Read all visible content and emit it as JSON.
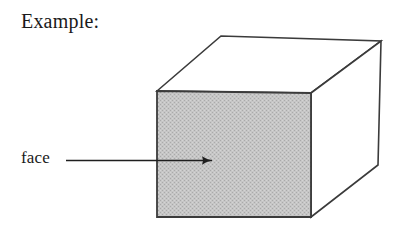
{
  "figure": {
    "heading": "Example:",
    "annotation_label": "face",
    "colors": {
      "background": "#ffffff",
      "outline": "#3b3b3b",
      "front_face_fill": "#c2c2c2",
      "text": "#1a1a1a",
      "arrow": "#1f1f1f"
    },
    "geometry": {
      "front_face": {
        "name": "shaded-front-face",
        "top_left": [
          157,
          91
        ],
        "top_right": [
          311,
          93
        ],
        "bottom_right": [
          311,
          217
        ],
        "bottom_left": [
          157,
          217
        ],
        "shaded": true
      },
      "top_face": {
        "name": "top-face",
        "front_left": [
          157,
          91
        ],
        "back_left": [
          221,
          36
        ],
        "back_right": [
          381,
          41
        ],
        "front_right": [
          311,
          93
        ],
        "shaded": false
      },
      "right_face": {
        "name": "right-side-face",
        "front_top": [
          311,
          93
        ],
        "back_top": [
          381,
          41
        ],
        "back_bottom": [
          378,
          165
        ],
        "front_bottom": [
          311,
          217
        ],
        "shaded": false
      },
      "arrow": {
        "name": "face-pointer-arrow",
        "start": [
          66,
          160
        ],
        "end": [
          221,
          160
        ],
        "direction": "right"
      }
    }
  }
}
